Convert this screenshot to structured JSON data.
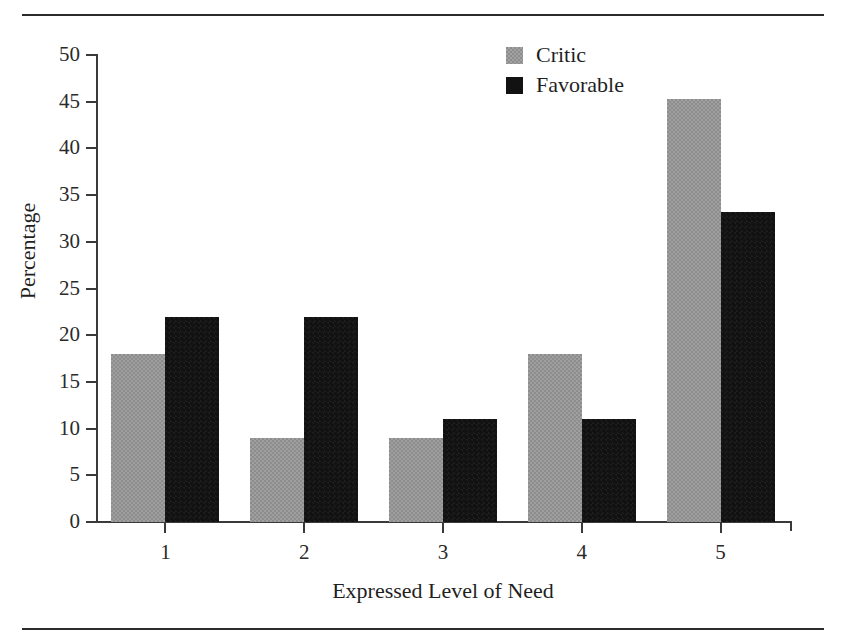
{
  "figure": {
    "background": "#ffffff",
    "rules": {
      "top_label": "top-rule",
      "bottom_label": "bottom-rule",
      "color": "#2b2b2b"
    }
  },
  "legend": {
    "position": "top-right",
    "entries": [
      {
        "label": "Critic",
        "color": "#8d8d8d",
        "swatch": "critic-swatch"
      },
      {
        "label": "Favorable",
        "color": "#121212",
        "swatch": "favorable-swatch"
      }
    ]
  },
  "axes": {
    "y": {
      "label": "Percentage",
      "ticks": [
        "0",
        "5",
        "10",
        "15",
        "20",
        "25",
        "30",
        "35",
        "40",
        "45",
        "50"
      ],
      "min": 0,
      "max": 50,
      "step": 5
    },
    "x": {
      "label": "Expressed Level of Need",
      "ticks": [
        "1",
        "2",
        "3",
        "4",
        "5"
      ]
    }
  },
  "chart_data": {
    "type": "bar",
    "title": "",
    "subtitle": "",
    "xlabel": "Expressed Level of Need",
    "ylabel": "Percentage",
    "categories": [
      "1",
      "2",
      "3",
      "4",
      "5"
    ],
    "series": [
      {
        "name": "Critic",
        "color": "#8d8d8d",
        "values": [
          18.0,
          9.0,
          9.0,
          18.0,
          45.3
        ]
      },
      {
        "name": "Favorable",
        "color": "#121212",
        "values": [
          22.0,
          22.0,
          11.0,
          11.0,
          33.2
        ]
      }
    ],
    "ylim": [
      0,
      50
    ],
    "ytick_step": 5,
    "grid": false,
    "legend_position": "top-right",
    "bar_grouping": "grouped-adjacent"
  }
}
